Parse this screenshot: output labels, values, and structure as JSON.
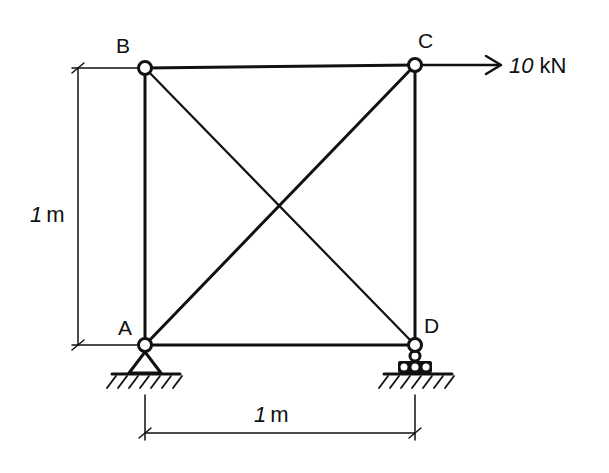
{
  "diagram": {
    "type": "truss",
    "colors": {
      "ink": "#111111",
      "background": "#ffffff"
    },
    "nodes": [
      {
        "id": "A",
        "label": "A",
        "support": "pin"
      },
      {
        "id": "B",
        "label": "B",
        "support": "none"
      },
      {
        "id": "C",
        "label": "C",
        "support": "none"
      },
      {
        "id": "D",
        "label": "D",
        "support": "roller"
      }
    ],
    "members": [
      "A-B",
      "B-C",
      "C-D",
      "A-D",
      "A-C",
      "B-D"
    ],
    "load": {
      "node": "C",
      "direction": "right",
      "label": "10 kN",
      "value_label": "10",
      "unit_label": "kN"
    },
    "dimensions": {
      "height": {
        "label": "1m",
        "value": "1",
        "unit": "m"
      },
      "width": {
        "label": "1m",
        "value": "1",
        "unit": "m"
      }
    }
  }
}
